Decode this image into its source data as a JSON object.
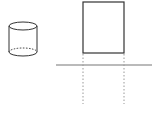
{
  "diagram": {
    "colors": {
      "stroke": "#333333",
      "baseline": "#777777",
      "dashed": "#999999",
      "background": "#ffffff"
    },
    "cylinder": {
      "cx": 23,
      "top_y": 26,
      "bottom_y": 52,
      "rx": 14,
      "ry": 4
    },
    "front_view": {
      "x": 83,
      "y": 2,
      "width": 41,
      "height": 51
    },
    "baseline": {
      "x1": 56,
      "x2": 152,
      "y": 65
    },
    "projection_lines": [
      {
        "x": 83,
        "y1": 53,
        "y2": 104
      },
      {
        "x": 124,
        "y1": 53,
        "y2": 104
      }
    ]
  }
}
